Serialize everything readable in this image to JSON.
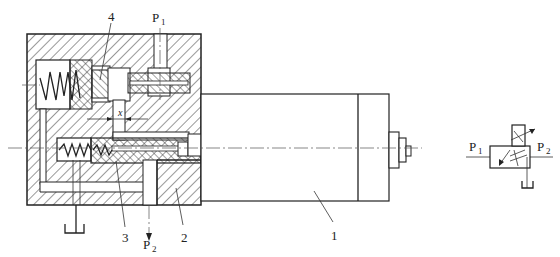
{
  "diagram": {
    "type": "hydraulic pressure-reducing valve cross-section with graphic symbol",
    "labels": {
      "part1": "1",
      "part2": "2",
      "part3": "3",
      "part4": "4",
      "inlet": "P",
      "inlet_sub": "1",
      "outlet": "P",
      "outlet_sub": "2",
      "displacement": "x"
    },
    "symbol": {
      "inlet": "P",
      "inlet_sub": "1",
      "outlet": "P",
      "outlet_sub": "2"
    },
    "colors": {
      "line": "#222222",
      "background": "#ffffff"
    }
  }
}
